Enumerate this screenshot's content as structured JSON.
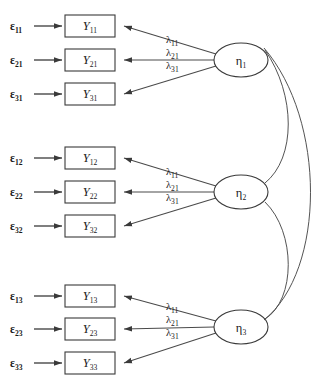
{
  "diagram": {
    "type": "structural-equation-model",
    "title": "",
    "blocks": [
      {
        "id": "block-1",
        "factor": {
          "symbol": "η",
          "sub": "1",
          "cx": 241,
          "cy": 60,
          "rx": 27,
          "ry": 17
        },
        "indicators": [
          {
            "y_symbol": "Y",
            "y_sub": "11",
            "err_symbol": "ε",
            "err_sub": "11",
            "loading_symbol": "λ",
            "loading_sub": "11",
            "box_y": 15
          },
          {
            "y_symbol": "Y",
            "y_sub": "21",
            "err_symbol": "ε",
            "err_sub": "21",
            "loading_symbol": "λ",
            "loading_sub": "21",
            "box_y": 49
          },
          {
            "y_symbol": "Y",
            "y_sub": "31",
            "err_symbol": "ε",
            "err_sub": "31",
            "loading_symbol": "λ",
            "loading_sub": "31",
            "box_y": 83
          }
        ]
      },
      {
        "id": "block-2",
        "factor": {
          "symbol": "η",
          "sub": "2",
          "cx": 241,
          "cy": 192,
          "rx": 27,
          "ry": 17
        },
        "indicators": [
          {
            "y_symbol": "Y",
            "y_sub": "12",
            "err_symbol": "ε",
            "err_sub": "12",
            "loading_symbol": "λ",
            "loading_sub": "11",
            "box_y": 147
          },
          {
            "y_symbol": "Y",
            "y_sub": "22",
            "err_symbol": "ε",
            "err_sub": "22",
            "loading_symbol": "λ",
            "loading_sub": "21",
            "box_y": 181
          },
          {
            "y_symbol": "Y",
            "y_sub": "32",
            "err_symbol": "ε",
            "err_sub": "32",
            "loading_symbol": "λ",
            "loading_sub": "31",
            "box_y": 215
          }
        ]
      },
      {
        "id": "block-3",
        "factor": {
          "symbol": "η",
          "sub": "3",
          "cx": 241,
          "cy": 327,
          "rx": 27,
          "ry": 17
        },
        "indicators": [
          {
            "y_symbol": "Y",
            "y_sub": "13",
            "err_symbol": "ε",
            "err_sub": "13",
            "loading_symbol": "λ",
            "loading_sub": "11",
            "box_y": 285
          },
          {
            "y_symbol": "Y",
            "y_sub": "23",
            "err_symbol": "ε",
            "err_sub": "23",
            "loading_symbol": "λ",
            "loading_sub": "21",
            "box_y": 318
          },
          {
            "y_symbol": "Y",
            "y_sub": "33",
            "err_symbol": "ε",
            "err_sub": "33",
            "loading_symbol": "λ",
            "loading_sub": "31",
            "box_y": 352
          }
        ]
      }
    ],
    "covariances": [
      {
        "id": "cov-eta1-eta2",
        "from": "η1",
        "to": "η2"
      },
      {
        "id": "cov-eta2-eta3",
        "from": "η2",
        "to": "η3"
      },
      {
        "id": "cov-eta1-eta3",
        "from": "η1",
        "to": "η3"
      }
    ],
    "geometry": {
      "box_x": 65,
      "box_w": 50,
      "box_h": 22,
      "eps_x": 10,
      "err_arrow_start": 34,
      "lam_x": 166
    },
    "colors": {
      "stroke": "#3a3a3a",
      "line": "#4a4a4a",
      "text": "#1a1a1a",
      "background": "#ffffff"
    }
  }
}
